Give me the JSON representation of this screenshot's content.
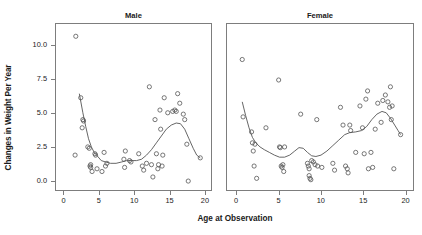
{
  "chart_data": {
    "type": "scatter",
    "title": "",
    "xlabel": "Age at Observation",
    "ylabel": "Changes in Weight Per Year",
    "xlim": [
      -1.2,
      21.0
    ],
    "ylim": [
      -0.7,
      11.6
    ],
    "xticks": [
      0,
      5,
      10,
      15,
      20
    ],
    "xticklabels": [
      "0",
      "5",
      "10",
      "15",
      "20"
    ],
    "yticks": [
      0.0,
      2.5,
      5.0,
      7.5,
      10.0
    ],
    "yticklabels": [
      "0.0",
      "2.5",
      "5.0",
      "7.5",
      "10.0"
    ],
    "grid": false,
    "legend": "none",
    "marker": "open-circle",
    "marker_color": "#555555",
    "line_color": "#555555",
    "panels": [
      {
        "name": "male",
        "label": "Male",
        "points": [
          [
            1.6,
            10.7
          ],
          [
            1.5,
            2.0
          ],
          [
            2.3,
            6.2
          ],
          [
            2.5,
            4.0
          ],
          [
            2.6,
            4.6
          ],
          [
            2.7,
            4.5
          ],
          [
            3.3,
            2.6
          ],
          [
            3.5,
            2.5
          ],
          [
            3.6,
            1.2
          ],
          [
            3.7,
            1.1
          ],
          [
            3.7,
            1.3
          ],
          [
            3.9,
            0.8
          ],
          [
            4.3,
            2.1
          ],
          [
            4.4,
            2.0
          ],
          [
            4.6,
            1.0
          ],
          [
            5.3,
            0.8
          ],
          [
            5.6,
            2.2
          ],
          [
            5.8,
            1.2
          ],
          [
            6.0,
            1.4
          ],
          [
            8.4,
            1.7
          ],
          [
            8.5,
            1.1
          ],
          [
            8.6,
            2.3
          ],
          [
            9.2,
            1.6
          ],
          [
            9.4,
            1.5
          ],
          [
            10.5,
            2.1
          ],
          [
            11.0,
            1.2
          ],
          [
            11.2,
            0.9
          ],
          [
            11.6,
            1.4
          ],
          [
            12.0,
            7.0
          ],
          [
            12.3,
            1.3
          ],
          [
            12.5,
            0.4
          ],
          [
            12.8,
            4.6
          ],
          [
            13.0,
            2.1
          ],
          [
            13.2,
            1.0
          ],
          [
            13.3,
            1.3
          ],
          [
            13.5,
            5.3
          ],
          [
            13.6,
            3.9
          ],
          [
            13.8,
            1.2
          ],
          [
            13.9,
            2.0
          ],
          [
            14.1,
            6.2
          ],
          [
            14.6,
            5.1
          ],
          [
            15.3,
            5.2
          ],
          [
            15.6,
            5.3
          ],
          [
            15.8,
            5.2
          ],
          [
            16.0,
            6.5
          ],
          [
            16.3,
            5.8
          ],
          [
            16.8,
            5.0
          ],
          [
            17.0,
            4.6
          ],
          [
            17.3,
            2.8
          ],
          [
            17.5,
            0.1
          ],
          [
            19.2,
            1.8
          ]
        ],
        "smooth": [
          [
            2.1,
            6.5
          ],
          [
            2.6,
            5.1
          ],
          [
            3.0,
            4.1
          ],
          [
            3.4,
            3.2
          ],
          [
            3.8,
            2.6
          ],
          [
            4.2,
            2.2
          ],
          [
            4.7,
            1.9
          ],
          [
            5.2,
            1.6
          ],
          [
            5.8,
            1.5
          ],
          [
            6.5,
            1.4
          ],
          [
            7.3,
            1.4
          ],
          [
            8.1,
            1.5
          ],
          [
            8.8,
            1.6
          ],
          [
            9.5,
            1.6
          ],
          [
            10.2,
            1.6
          ],
          [
            10.9,
            1.7
          ],
          [
            11.6,
            2.0
          ],
          [
            12.3,
            2.4
          ],
          [
            13.0,
            2.9
          ],
          [
            13.7,
            3.4
          ],
          [
            14.4,
            3.9
          ],
          [
            15.1,
            4.2
          ],
          [
            15.8,
            4.35
          ],
          [
            16.4,
            4.3
          ],
          [
            17.0,
            3.9
          ],
          [
            17.6,
            3.2
          ],
          [
            18.2,
            2.5
          ],
          [
            18.7,
            2.0
          ],
          [
            19.2,
            1.8
          ]
        ]
      },
      {
        "name": "female",
        "label": "Female",
        "points": [
          [
            0.6,
            9.0
          ],
          [
            0.7,
            4.8
          ],
          [
            1.7,
            3.7
          ],
          [
            1.8,
            2.9
          ],
          [
            1.9,
            2.3
          ],
          [
            2.0,
            1.2
          ],
          [
            2.1,
            2.8
          ],
          [
            2.3,
            0.3
          ],
          [
            3.4,
            4.0
          ],
          [
            4.9,
            7.5
          ],
          [
            5.0,
            2.6
          ],
          [
            5.1,
            2.55
          ],
          [
            5.2,
            1.2
          ],
          [
            5.3,
            1.1
          ],
          [
            5.4,
            1.3
          ],
          [
            5.5,
            0.8
          ],
          [
            5.6,
            2.6
          ],
          [
            7.5,
            5.0
          ],
          [
            8.3,
            1.4
          ],
          [
            8.4,
            1.2
          ],
          [
            8.5,
            1.0
          ],
          [
            8.5,
            0.5
          ],
          [
            8.6,
            0.3
          ],
          [
            8.7,
            0.2
          ],
          [
            8.8,
            1.6
          ],
          [
            9.0,
            1.5
          ],
          [
            9.2,
            1.3
          ],
          [
            9.4,
            4.6
          ],
          [
            9.5,
            1.2
          ],
          [
            10.0,
            1.1
          ],
          [
            11.3,
            1.4
          ],
          [
            11.5,
            0.9
          ],
          [
            12.2,
            5.5
          ],
          [
            12.5,
            4.2
          ],
          [
            12.8,
            1.2
          ],
          [
            13.0,
            1.0
          ],
          [
            13.1,
            0.7
          ],
          [
            13.3,
            4.2
          ],
          [
            13.4,
            3.8
          ],
          [
            14.0,
            2.2
          ],
          [
            14.5,
            5.6
          ],
          [
            14.8,
            4.0
          ],
          [
            15.0,
            2.1
          ],
          [
            15.2,
            6.1
          ],
          [
            15.4,
            6.7
          ],
          [
            15.5,
            1.0
          ],
          [
            15.8,
            2.2
          ],
          [
            16.0,
            1.1
          ],
          [
            16.3,
            3.9
          ],
          [
            16.6,
            5.8
          ],
          [
            17.0,
            4.4
          ],
          [
            17.2,
            6.0
          ],
          [
            17.5,
            6.4
          ],
          [
            17.8,
            5.9
          ],
          [
            18.0,
            5.5
          ],
          [
            18.1,
            7.0
          ],
          [
            18.2,
            4.6
          ],
          [
            18.3,
            5.6
          ],
          [
            18.5,
            1.0
          ],
          [
            19.3,
            3.5
          ]
        ],
        "smooth": [
          [
            0.6,
            5.9
          ],
          [
            1.0,
            4.9
          ],
          [
            1.4,
            4.0
          ],
          [
            1.8,
            3.3
          ],
          [
            2.2,
            2.9
          ],
          [
            2.7,
            2.6
          ],
          [
            3.2,
            2.4
          ],
          [
            3.8,
            2.2
          ],
          [
            4.4,
            2.0
          ],
          [
            5.0,
            1.85
          ],
          [
            5.6,
            1.85
          ],
          [
            6.2,
            2.0
          ],
          [
            6.8,
            2.3
          ],
          [
            7.3,
            2.55
          ],
          [
            7.8,
            2.5
          ],
          [
            8.3,
            2.2
          ],
          [
            8.8,
            1.95
          ],
          [
            9.3,
            1.9
          ],
          [
            9.9,
            2.0
          ],
          [
            10.6,
            2.3
          ],
          [
            11.3,
            2.7
          ],
          [
            12.0,
            3.1
          ],
          [
            12.7,
            3.5
          ],
          [
            13.3,
            3.65
          ],
          [
            14.0,
            3.7
          ],
          [
            14.7,
            3.8
          ],
          [
            15.3,
            4.1
          ],
          [
            15.9,
            4.6
          ],
          [
            16.5,
            5.0
          ],
          [
            17.1,
            5.2
          ],
          [
            17.6,
            5.1
          ],
          [
            18.1,
            4.7
          ],
          [
            18.6,
            4.2
          ],
          [
            19.0,
            3.8
          ],
          [
            19.3,
            3.5
          ]
        ]
      }
    ]
  }
}
